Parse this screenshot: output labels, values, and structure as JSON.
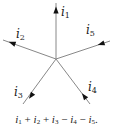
{
  "diagram": {
    "type": "current-node",
    "center": [
      56,
      59
    ],
    "colors": {
      "line": "#888888",
      "arrow": "#111111",
      "text": "#222222"
    },
    "branches": [
      {
        "id": "i1",
        "label": "i",
        "sub": "1",
        "end": [
          56,
          3
        ],
        "arrow_at": [
          56,
          10
        ],
        "direction": "outward",
        "label_pos": [
          61,
          16
        ]
      },
      {
        "id": "i2",
        "label": "i",
        "sub": "2",
        "end": [
          3,
          40
        ],
        "arrow_at": [
          12,
          43
        ],
        "direction": "outward",
        "label_pos": [
          16,
          38
        ]
      },
      {
        "id": "i5",
        "label": "i",
        "sub": "5",
        "end": [
          110,
          41
        ],
        "arrow_at": [
          101,
          44
        ],
        "direction": "inward",
        "label_pos": [
          86,
          34
        ]
      },
      {
        "id": "i3",
        "label": "i",
        "sub": "3",
        "end": [
          23,
          104
        ],
        "arrow_at": [
          31,
          96
        ],
        "direction": "outward",
        "label_pos": [
          14,
          96
        ]
      },
      {
        "id": "i4",
        "label": "i",
        "sub": "4",
        "end": [
          90,
          104
        ],
        "arrow_at": [
          84,
          96
        ],
        "direction": "inward",
        "label_pos": [
          88,
          91
        ]
      }
    ]
  },
  "equation": {
    "terms": [
      {
        "sign": "",
        "var": "i",
        "sub": "1"
      },
      {
        "sign": "+",
        "var": "i",
        "sub": "2"
      },
      {
        "sign": "+",
        "var": "i",
        "sub": "3"
      },
      {
        "sign": "−",
        "var": "i",
        "sub": "4"
      },
      {
        "sign": "−",
        "var": "i",
        "sub": "5"
      }
    ],
    "trailing": "."
  }
}
